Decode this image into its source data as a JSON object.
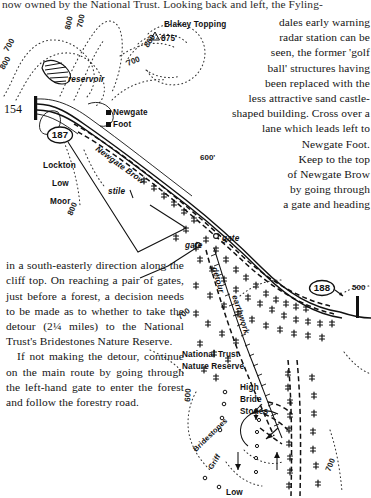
{
  "page": {
    "domain": "Map",
    "top_text": "now owned by the National Trust. Looking back and left, the Fyling-",
    "right_column": "dales early warning\nradar station can be\nseen, the former 'golf\nball' structures having\nbeen replaced with the\nless attractive sand castle-\nshaped building. Cross over a\nlane which leads left to\nNewgate Foot.\nKeep to the top\nof Newgate Brow\nby going through\na gate and heading",
    "left_column_para1": "in a south-easterly direction along the cliff top. On reaching a pair of gates, just before a forest, a decision needs to be made as to whether to take the detour (2¼ miles) to the National Trust's Bridestones Nature Reserve.",
    "left_column_para2": "If not making the detour, continue on the main route by going through the left-hand gate to enter the forest and follow the forestry road."
  },
  "map": {
    "grid_reference": "154",
    "waypoints": [
      {
        "id": "187",
        "label": "187"
      },
      {
        "id": "188",
        "label": "188"
      }
    ],
    "place_labels": [
      {
        "name": "reservoir",
        "text": "reservoir"
      },
      {
        "name": "blakey-topping",
        "text": "Blakey Topping"
      },
      {
        "name": "blakey-topping-height",
        "text": "875'"
      },
      {
        "name": "newgate",
        "text": "Newgate"
      },
      {
        "name": "newgate-foot",
        "text": "Foot"
      },
      {
        "name": "newgate-brow",
        "text": "Newgate Brow"
      },
      {
        "name": "lockton",
        "text": "Lockton"
      },
      {
        "name": "lockton-low",
        "text": "Low"
      },
      {
        "name": "lockton-moor",
        "text": "Moor"
      },
      {
        "name": "stile",
        "text": "stile"
      },
      {
        "name": "gate-left",
        "text": "gate"
      },
      {
        "name": "gate-right",
        "text": "gate"
      },
      {
        "name": "detour",
        "text": "detour"
      },
      {
        "name": "earthwork",
        "text": "earthwork"
      },
      {
        "name": "national-trust",
        "text": "National Trust"
      },
      {
        "name": "nature-reserve",
        "text": "Nature Reserve"
      },
      {
        "name": "high",
        "text": "High"
      },
      {
        "name": "bride",
        "text": "Bride"
      },
      {
        "name": "stones",
        "text": "Stones"
      },
      {
        "name": "bridestones",
        "text": "Bridestones"
      },
      {
        "name": "griff",
        "text": "Griff"
      },
      {
        "name": "low-bottom",
        "text": "Low"
      }
    ],
    "contours": [
      {
        "name": "contour-800-a",
        "text": "800"
      },
      {
        "name": "contour-700-a",
        "text": "700"
      },
      {
        "name": "contour-700-b",
        "text": "700"
      },
      {
        "name": "contour-800-b",
        "text": "800"
      },
      {
        "name": "contour-800-c",
        "text": "800"
      },
      {
        "name": "contour-700-c",
        "text": "700"
      },
      {
        "name": "contour-800-d",
        "text": "800"
      },
      {
        "name": "contour-600-a",
        "text": "600'"
      },
      {
        "name": "contour-500-a",
        "text": "500"
      },
      {
        "name": "contour-700-d",
        "text": "700"
      },
      {
        "name": "contour-600-b",
        "text": "600"
      },
      {
        "name": "contour-700-e",
        "text": "700"
      }
    ],
    "colors": {
      "ink": "#111111",
      "paper": "#ffffff"
    }
  }
}
